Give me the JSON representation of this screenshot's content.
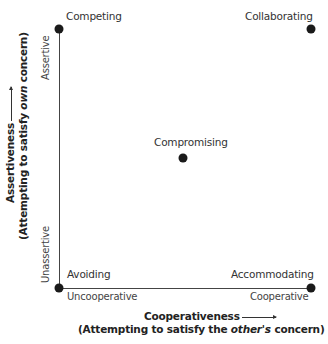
{
  "modes": {
    "competing": "Competing",
    "collaborating": "Collaborating",
    "compromising": "Compromising",
    "avoiding": "Avoiding",
    "accommodating": "Accommodating"
  },
  "poles": {
    "assertive": "Assertive",
    "unassertive": "Unassertive",
    "uncooperative": "Uncooperative",
    "cooperative": "Cooperative"
  },
  "x_axis": {
    "title": "Cooperativeness",
    "subtitle_pre": "(Attempting to satisfy the ",
    "subtitle_em": "other's",
    "subtitle_post": " concern)"
  },
  "y_axis": {
    "title": "Assertiveness",
    "subtitle_pre": "(Attempting to satisfy ",
    "subtitle_em": "own",
    "subtitle_post": " concern)"
  },
  "colors": {
    "dot": "#1a1a1a",
    "axis": "#444444"
  }
}
